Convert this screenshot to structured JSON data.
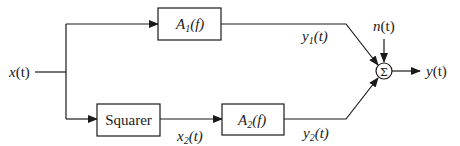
{
  "diagram": {
    "type": "block-diagram",
    "input": {
      "base": "x",
      "arg": "(t)"
    },
    "blocks": {
      "a1": {
        "base": "A",
        "sub": "1",
        "arg": "(f)"
      },
      "squarer": {
        "label": "Squarer"
      },
      "a2": {
        "base": "A",
        "sub": "2",
        "arg": "(f)"
      }
    },
    "signals": {
      "x2": {
        "base": "x",
        "sub": "2",
        "arg": "(t)"
      },
      "y1": {
        "base": "y",
        "sub": "1",
        "arg": "(t)"
      },
      "y2": {
        "base": "y",
        "sub": "2",
        "arg": "(t)"
      },
      "noise": {
        "base": "n",
        "arg": "(t)"
      }
    },
    "summer": {
      "symbol": "Σ"
    },
    "output": {
      "base": "y",
      "arg": "(t)"
    },
    "edges": [
      "x(t) -> A1(f)",
      "x(t) -> Squarer",
      "Squarer -> A2(f) [x2(t)]",
      "A1(f) -> Σ [y1(t)]",
      "A2(f) -> Σ [y2(t)]",
      "n(t) -> Σ",
      "Σ -> y(t)"
    ]
  }
}
